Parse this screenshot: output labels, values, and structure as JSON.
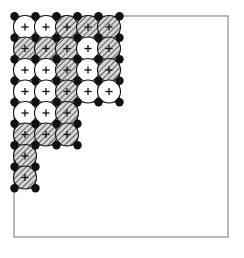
{
  "figure": {
    "title": "",
    "type": "packed-circle-lattice-diagram",
    "frame": {
      "x": 14,
      "y": 16,
      "width": 214,
      "height": 221,
      "stroke_color": "#8a8a8a",
      "stroke_width": 1.2,
      "fill_color": "#ffffff"
    },
    "lattice": {
      "origin_x": 25,
      "origin_y": 27,
      "spacing_x": 21,
      "spacing_y": 21.5,
      "circle_radius": 11.5,
      "circle_stroke_color": "#111111",
      "circle_stroke_width": 1.1,
      "white_fill": "#ffffff",
      "hatch_fill_base": "#d6d6d6",
      "hatch_line_color": "#2a2a2a",
      "center_cross_color": "#111111",
      "center_cross_size": 3.6,
      "node_dot_color": "#111111",
      "node_dot_radius": 4.2,
      "boundary_stroke_color": "#555555",
      "boundary_stroke_width": 1.0
    },
    "rows": [
      {
        "index": 0,
        "cells": [
          "white",
          "white",
          "hatched",
          "hatched",
          "hatched"
        ]
      },
      {
        "index": 1,
        "cells": [
          "hatched",
          "hatched",
          "hatched",
          "white",
          "hatched"
        ]
      },
      {
        "index": 2,
        "cells": [
          "white",
          "white",
          "hatched",
          "white",
          "hatched"
        ]
      },
      {
        "index": 3,
        "cells": [
          "white",
          "white",
          "hatched",
          "white",
          "white"
        ]
      },
      {
        "index": 4,
        "cells": [
          "white",
          "white",
          "hatched"
        ]
      },
      {
        "index": 5,
        "cells": [
          "hatched",
          "hatched",
          "hatched"
        ]
      },
      {
        "index": 6,
        "cells": [
          "hatched"
        ]
      },
      {
        "index": 7,
        "cells": [
          "hatched"
        ]
      }
    ],
    "legend": {
      "white_label": "open site",
      "hatched_label": "filled site",
      "dot_label": "lattice node"
    }
  }
}
